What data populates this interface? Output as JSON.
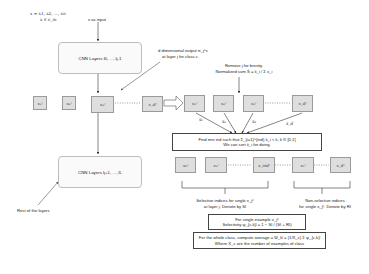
{
  "input": {
    "sequence": "x = x1, x2, ..., xn",
    "membership": "x ∈ c_m",
    "label": "x as input"
  },
  "cnn_top": {
    "label": "CNN Layers l0, ..., lj-1"
  },
  "cnn_bottom": {
    "label": "CNN Layers lj+1, ..., lL"
  },
  "rest_label": "Rest of the layers",
  "output_annotation": {
    "line1": "d dimensional output π_j^c",
    "line2": "at layer j for class c."
  },
  "normalize_annotation": {
    "line1": "Remove j for brevity.",
    "line2": "Normalized sum S̄ = x̄_i / Σ x_i"
  },
  "layer_outputs": [
    "x₁ʲ",
    "x₂ʲ",
    "x₃ʲ",
    "x_dʲ"
  ],
  "normalized_outputs": [
    "x₁ʲ",
    "x₂ʲ",
    "x₃ʲ",
    "x_dʲ"
  ],
  "edge_labels": [
    "x̄₁",
    "x̄₂",
    "x̄₃",
    "x̄_d"
  ],
  "find_min_box": {
    "line1": "Find min ind such that Σ_{i=1}^{ind} x̄_i < k, k ∈ [0,1]",
    "line2": "We can sort x̄_i for doing."
  },
  "sorted_outputs": [
    "x₀ʲ",
    "x₁ʲ",
    "x_indʲ",
    "x₁ʲ",
    "x_dʲ"
  ],
  "selective_label": {
    "line1": "Selective indices for single x_jᶜ",
    "line2": "at layer j. Denote by SI"
  },
  "nonselective_label": {
    "line1": "Non-selective indices",
    "line2": "for single x_jᶜ. Denote by RI"
  },
  "selectivity_box": {
    "line1": "For single example x_jᶜ",
    "line2": "Selectivity ψ_{c,k}ʲ = 1 − SI / (SI + RI)"
  },
  "class_average_box": {
    "line1": "For the whole class, compute average = Ψ_kʲ = (1/X_c) Σ ψ_{c,k}ʲ",
    "line2": "Where X_c are the number of examples of class"
  },
  "colors": {
    "node_fill": "#dedede",
    "node_border": "#9a9a9a",
    "cnn_border": "#bdbdbd",
    "frame_border": "#444444",
    "arrow": "#333333"
  }
}
